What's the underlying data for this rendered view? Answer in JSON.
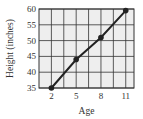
{
  "chart_data": {
    "type": "line",
    "title": "",
    "xlabel": "Age",
    "ylabel": "Height (inches)",
    "x": [
      2,
      5,
      8,
      11
    ],
    "series": [
      {
        "name": "Height",
        "values": [
          35,
          44,
          51,
          59.5
        ]
      }
    ],
    "xticks": [
      "2",
      "5",
      "8",
      "11"
    ],
    "yticks": [
      "35",
      "40",
      "45",
      "50",
      "55",
      "60"
    ],
    "xlim": [
      0.5,
      12
    ],
    "ylim": [
      35,
      60
    ],
    "grid": true,
    "colors": {
      "line": "#222222",
      "grid": "#333333",
      "background": "#eeeeee"
    }
  }
}
